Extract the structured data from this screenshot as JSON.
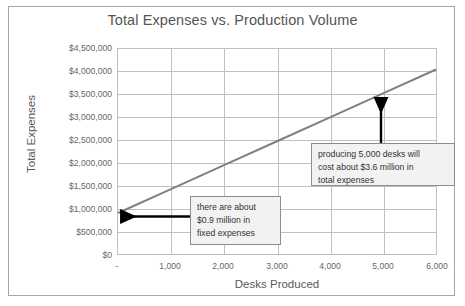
{
  "chart_data": {
    "type": "line",
    "title": "Total Expenses vs. Production Volume",
    "xlabel": "Desks Produced",
    "ylabel": "Total Expenses",
    "x": [
      0,
      1000,
      2000,
      3000,
      4000,
      5000,
      6000
    ],
    "values": [
      900000,
      1425000,
      1950000,
      2475000,
      3000000,
      3525000,
      4050000
    ],
    "series": [
      {
        "name": "Total Expenses",
        "values": [
          900000,
          1425000,
          1950000,
          2475000,
          3000000,
          3525000,
          4050000
        ],
        "color": "#808080"
      }
    ],
    "xlim": [
      0,
      6000
    ],
    "ylim": [
      0,
      4500000
    ],
    "xticks": [
      "-",
      "1,000",
      "2,000",
      "3,000",
      "4,000",
      "5,000",
      "6,000"
    ],
    "yticks": [
      "$4,500,000",
      "$4,000,000",
      "$3,500,000",
      "$3,000,000",
      "$2,500,000",
      "$2,000,000",
      "$1,500,000",
      "$1,000,000",
      "$500,000",
      "$0"
    ],
    "grid": "both",
    "legend": "none",
    "annotations": [
      {
        "id": "fixed-expenses",
        "text": "there are about $0.9 million in fixed expenses",
        "lines": [
          "there are about",
          "$0.9 million in",
          "fixed expenses"
        ],
        "points_to_x": 0,
        "points_to_y": 900000,
        "arrow": "left"
      },
      {
        "id": "cost-at-5000",
        "text": "producing 5,000 desks will cost about $3.6 million in total expenses",
        "lines": [
          "producing 5,000 desks will",
          "cost about $3.6 million in",
          "total expenses"
        ],
        "points_to_x": 5000,
        "points_to_y": 3525000,
        "arrow": "up"
      }
    ],
    "colors": {
      "line": "#808080",
      "gridline": "#bfbfbf",
      "plot_border": "#bfbfbf",
      "text": "#595959",
      "tick_text": "#666666",
      "callout_fill": "#f2f2f2",
      "callout_border": "#8c8c8c",
      "arrow": "#000000",
      "frame": "#a6a6a6"
    }
  }
}
